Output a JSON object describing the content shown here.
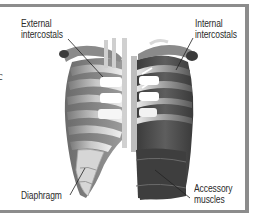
{
  "figure": {
    "clipped_glyph": "c",
    "labels": {
      "external_intercostals": [
        "External",
        "intercostals"
      ],
      "internal_intercostals": [
        "Internal",
        "intercostals"
      ],
      "diaphragm": "Diaphragm",
      "accessory_muscles": [
        "Accessory",
        "muscles"
      ]
    },
    "colors": {
      "frame": "#8c8c8c",
      "bone_light": "#e8e8e8",
      "muscle_dark": "#4a4a4a",
      "label_text": "#2b2b2b"
    }
  }
}
